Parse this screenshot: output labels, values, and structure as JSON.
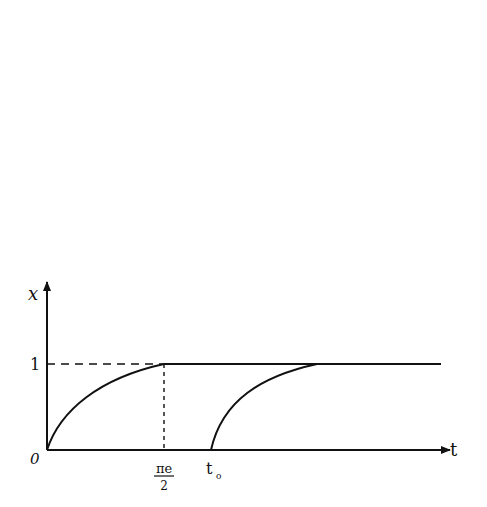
{
  "figure": {
    "y_axis_label": "x",
    "x_axis_label": "t",
    "origin_label": "0",
    "y_tick_label": "1",
    "x_tick_1_num": "πe",
    "x_tick_1_den": "2",
    "x_tick_2": "t",
    "x_tick_2_sub": "o"
  },
  "colors": {
    "ink": "#111111",
    "background": "#ffffff"
  }
}
